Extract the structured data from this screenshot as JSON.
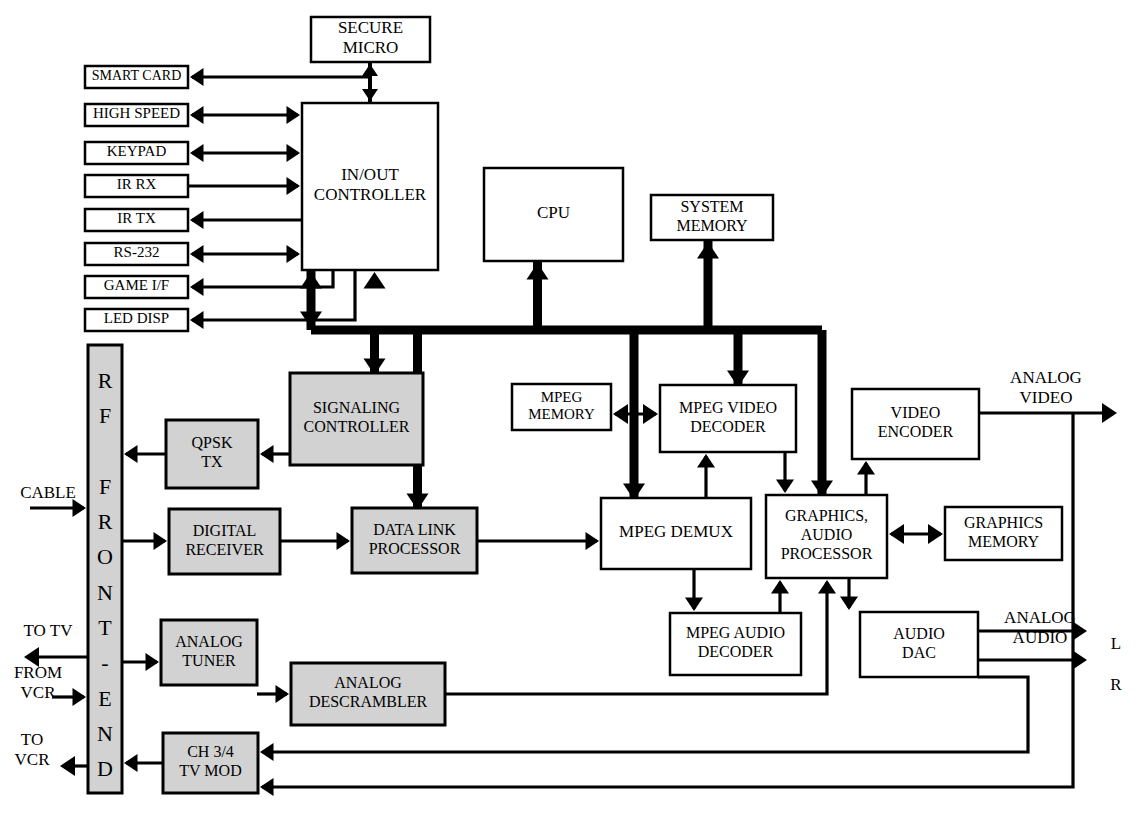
{
  "diagram": {
    "colors": {
      "shaded": "#d2d2d2",
      "plain": "#ffffff",
      "line": "#000000"
    }
  },
  "blocks": [
    {
      "id": "secure_micro",
      "label": "SECURE MICRO",
      "lines": [
        "SECURE",
        "MICRO"
      ],
      "x": 311,
      "y": 17,
      "w": 119,
      "h": 45,
      "fill": "plain",
      "stroke": 2.5,
      "fontsize": 17
    },
    {
      "id": "smart_card",
      "label": "SMART CARD",
      "lines": [
        "SMART CARD"
      ],
      "x": 85,
      "y": 66,
      "w": 103,
      "h": 22,
      "fill": "plain",
      "stroke": 2.5,
      "fontsize": 14
    },
    {
      "id": "high_speed",
      "label": "HIGH SPEED",
      "lines": [
        "HIGH SPEED"
      ],
      "x": 85,
      "y": 104,
      "w": 103,
      "h": 22,
      "fill": "plain",
      "stroke": 2.5,
      "fontsize": 15
    },
    {
      "id": "keypad",
      "label": "KEYPAD",
      "lines": [
        "KEYPAD"
      ],
      "x": 85,
      "y": 142,
      "w": 103,
      "h": 22,
      "fill": "plain",
      "stroke": 2.5,
      "fontsize": 15
    },
    {
      "id": "ir_rx",
      "label": "IR RX",
      "lines": [
        "IR RX"
      ],
      "x": 85,
      "y": 175,
      "w": 103,
      "h": 22,
      "fill": "plain",
      "stroke": 2.5,
      "fontsize": 15
    },
    {
      "id": "ir_tx",
      "label": "IR TX",
      "lines": [
        "IR TX"
      ],
      "x": 85,
      "y": 209,
      "w": 103,
      "h": 22,
      "fill": "plain",
      "stroke": 2.5,
      "fontsize": 15
    },
    {
      "id": "rs232",
      "label": "RS-232",
      "lines": [
        "RS-232"
      ],
      "x": 85,
      "y": 243,
      "w": 103,
      "h": 22,
      "fill": "plain",
      "stroke": 2.5,
      "fontsize": 15
    },
    {
      "id": "game_if",
      "label": "GAME I/F",
      "lines": [
        "GAME I/F"
      ],
      "x": 85,
      "y": 276,
      "w": 103,
      "h": 22,
      "fill": "plain",
      "stroke": 2.5,
      "fontsize": 15
    },
    {
      "id": "led_disp",
      "label": "LED DISP",
      "lines": [
        "LED DISP"
      ],
      "x": 85,
      "y": 309,
      "w": 103,
      "h": 22,
      "fill": "plain",
      "stroke": 2.5,
      "fontsize": 15
    },
    {
      "id": "in_out_controller",
      "label": "IN/OUT CONTROLLER",
      "lines": [
        "IN/OUT",
        "CONTROLLER"
      ],
      "x": 302,
      "y": 103,
      "w": 136,
      "h": 167,
      "fill": "plain",
      "stroke": 2.5,
      "fontsize": 17
    },
    {
      "id": "cpu",
      "label": "CPU",
      "lines": [
        "CPU"
      ],
      "x": 484,
      "y": 168,
      "w": 139,
      "h": 93,
      "fill": "plain",
      "stroke": 2.5,
      "fontsize": 17
    },
    {
      "id": "system_memory",
      "label": "SYSTEM MEMORY",
      "lines": [
        "SYSTEM",
        "MEMORY"
      ],
      "x": 651,
      "y": 195,
      "w": 122,
      "h": 45,
      "fill": "plain",
      "stroke": 2.5,
      "fontsize": 16
    },
    {
      "id": "rf_front_end",
      "label": "RF FRONT-END",
      "lines": [
        "R",
        "F",
        "",
        "F",
        "R",
        "O",
        "N",
        "T",
        "-",
        "E",
        "N",
        "D"
      ],
      "x": 88,
      "y": 345,
      "w": 34,
      "h": 448,
      "fill": "shaded",
      "stroke": 3,
      "fontsize": 22,
      "vertical": true
    },
    {
      "id": "signaling_controller",
      "label": "SIGNALING CONTROLLER",
      "lines": [
        "SIGNALING",
        "CONTROLLER"
      ],
      "x": 290,
      "y": 373,
      "w": 133,
      "h": 92,
      "fill": "shaded",
      "stroke": 3,
      "fontsize": 16
    },
    {
      "id": "mpeg_memory",
      "label": "MPEG MEMORY",
      "lines": [
        "MPEG",
        "MEMORY"
      ],
      "x": 512,
      "y": 384,
      "w": 99,
      "h": 46,
      "fill": "plain",
      "stroke": 2.5,
      "fontsize": 15
    },
    {
      "id": "mpeg_video_decoder",
      "label": "MPEG VIDEO DECODER",
      "lines": [
        "MPEG VIDEO",
        "DECODER"
      ],
      "x": 660,
      "y": 385,
      "w": 136,
      "h": 67,
      "fill": "plain",
      "stroke": 2.5,
      "fontsize": 16
    },
    {
      "id": "video_encoder",
      "label": "VIDEO ENCODER",
      "lines": [
        "VIDEO",
        "ENCODER"
      ],
      "x": 852,
      "y": 389,
      "w": 127,
      "h": 70,
      "fill": "plain",
      "stroke": 2.5,
      "fontsize": 16
    },
    {
      "id": "qpsk_tx",
      "label": "QPSK TX",
      "lines": [
        "QPSK",
        "TX"
      ],
      "x": 166,
      "y": 420,
      "w": 92,
      "h": 68,
      "fill": "shaded",
      "stroke": 3,
      "fontsize": 16
    },
    {
      "id": "digital_receiver",
      "label": "DIGITAL RECEIVER",
      "lines": [
        "DIGITAL",
        "RECEIVER"
      ],
      "x": 169,
      "y": 509,
      "w": 111,
      "h": 65,
      "fill": "shaded",
      "stroke": 3,
      "fontsize": 16
    },
    {
      "id": "data_link_processor",
      "label": "DATA LINK PROCESSOR",
      "lines": [
        "DATA LINK",
        "PROCESSOR"
      ],
      "x": 352,
      "y": 508,
      "w": 125,
      "h": 65,
      "fill": "shaded",
      "stroke": 3,
      "fontsize": 16
    },
    {
      "id": "mpeg_demux",
      "label": "MPEG DEMUX",
      "lines": [
        "MPEG DEMUX"
      ],
      "x": 601,
      "y": 498,
      "w": 150,
      "h": 71,
      "fill": "plain",
      "stroke": 2.5,
      "fontsize": 17
    },
    {
      "id": "graphics_audio_proc",
      "label": "GRAPHICS, AUDIO PROCESSOR",
      "lines": [
        "GRAPHICS,",
        "AUDIO",
        "PROCESSOR"
      ],
      "x": 766,
      "y": 495,
      "w": 121,
      "h": 83,
      "fill": "plain",
      "stroke": 2.5,
      "fontsize": 16
    },
    {
      "id": "graphics_memory",
      "label": "GRAPHICS MEMORY",
      "lines": [
        "GRAPHICS",
        "MEMORY"
      ],
      "x": 945,
      "y": 507,
      "w": 117,
      "h": 53,
      "fill": "plain",
      "stroke": 2.5,
      "fontsize": 16
    },
    {
      "id": "mpeg_audio_decoder",
      "label": "MPEG AUDIO DECODER",
      "lines": [
        "MPEG AUDIO",
        "DECODER"
      ],
      "x": 670,
      "y": 613,
      "w": 131,
      "h": 62,
      "fill": "plain",
      "stroke": 2.5,
      "fontsize": 16
    },
    {
      "id": "audio_dac",
      "label": "AUDIO DAC",
      "lines": [
        "AUDIO",
        "DAC"
      ],
      "x": 860,
      "y": 612,
      "w": 118,
      "h": 65,
      "fill": "plain",
      "stroke": 2.5,
      "fontsize": 16
    },
    {
      "id": "analog_tuner",
      "label": "ANALOG TUNER",
      "lines": [
        "ANALOG",
        "TUNER"
      ],
      "x": 161,
      "y": 620,
      "w": 96,
      "h": 65,
      "fill": "shaded",
      "stroke": 3,
      "fontsize": 16
    },
    {
      "id": "analog_descrambler",
      "label": "ANALOG DESCRAMBLER",
      "lines": [
        "ANALOG",
        "DESCRAMBLER"
      ],
      "x": 291,
      "y": 663,
      "w": 154,
      "h": 62,
      "fill": "shaded",
      "stroke": 3,
      "fontsize": 16
    },
    {
      "id": "ch34_tv_mod",
      "label": "CH 3/4 TV MOD",
      "lines": [
        "CH 3/4",
        "TV MOD"
      ],
      "x": 163,
      "y": 733,
      "w": 95,
      "h": 60,
      "fill": "shaded",
      "stroke": 3,
      "fontsize": 16
    }
  ],
  "io_labels": [
    {
      "id": "cable",
      "lines": [
        "CABLE"
      ],
      "x": 48,
      "y": 494,
      "anchor": "middle",
      "fontsize": 17
    },
    {
      "id": "to_tv",
      "lines": [
        "TO TV"
      ],
      "x": 48,
      "y": 632,
      "anchor": "middle",
      "fontsize": 17
    },
    {
      "id": "from_vcr",
      "lines": [
        "FROM",
        "VCR"
      ],
      "x": 38,
      "y": 674,
      "anchor": "middle",
      "fontsize": 17
    },
    {
      "id": "to_vcr",
      "lines": [
        "TO",
        "VCR"
      ],
      "x": 32,
      "y": 741,
      "anchor": "middle",
      "fontsize": 17
    },
    {
      "id": "analog_video",
      "lines": [
        "ANALOG",
        "VIDEO"
      ],
      "x": 1046,
      "y": 379,
      "anchor": "middle",
      "fontsize": 17
    },
    {
      "id": "analog_audio",
      "lines": [
        "ANALOG",
        "AUDIO"
      ],
      "x": 1040,
      "y": 619,
      "anchor": "middle",
      "fontsize": 17
    },
    {
      "id": "channel_left",
      "lines": [
        "L"
      ],
      "x": 1116,
      "y": 645,
      "anchor": "middle",
      "fontsize": 17
    },
    {
      "id": "channel_right",
      "lines": [
        "R"
      ],
      "x": 1116,
      "y": 686,
      "anchor": "middle",
      "fontsize": 17
    }
  ],
  "connections": [
    {
      "id": "secure-micro-to-iocontroller",
      "from": "secure_micro",
      "to": "in_out_controller",
      "type": "bidirectional"
    },
    {
      "id": "iocontroller-to-smart-card",
      "from": "in_out_controller",
      "to": "smart_card",
      "type": "unidirectional"
    },
    {
      "id": "iocontroller-high-speed",
      "from": "in_out_controller",
      "to": "high_speed",
      "type": "bidirectional"
    },
    {
      "id": "iocontroller-keypad",
      "from": "in_out_controller",
      "to": "keypad",
      "type": "bidirectional"
    },
    {
      "id": "ir-rx-to-iocontroller",
      "from": "ir_rx",
      "to": "in_out_controller",
      "type": "unidirectional"
    },
    {
      "id": "iocontroller-to-ir-tx",
      "from": "in_out_controller",
      "to": "ir_tx",
      "type": "unidirectional"
    },
    {
      "id": "iocontroller-rs232",
      "from": "in_out_controller",
      "to": "rs232",
      "type": "bidirectional"
    },
    {
      "id": "iocontroller-to-game-if",
      "from": "in_out_controller",
      "to": "game_if",
      "type": "unidirectional"
    },
    {
      "id": "iocontroller-to-led-disp",
      "from": "in_out_controller",
      "to": "led_disp",
      "type": "unidirectional"
    },
    {
      "id": "iocontroller-to-bus",
      "from": "in_out_controller",
      "to": "system_bus",
      "type": "bidirectional"
    },
    {
      "id": "bus-to-cpu",
      "from": "system_bus",
      "to": "cpu",
      "type": "unidirectional"
    },
    {
      "id": "bus-to-system-memory",
      "from": "system_bus",
      "to": "system_memory",
      "type": "unidirectional"
    },
    {
      "id": "bus-to-signaling-controller",
      "from": "system_bus",
      "to": "signaling_controller",
      "type": "bidirectional"
    },
    {
      "id": "bus-to-data-link-processor",
      "from": "system_bus",
      "to": "data_link_processor",
      "type": "unidirectional"
    },
    {
      "id": "bus-to-mpeg-video-decoder",
      "from": "system_bus",
      "to": "mpeg_video_decoder",
      "type": "unidirectional"
    },
    {
      "id": "bus-to-mpeg-demux",
      "from": "system_bus",
      "to": "mpeg_demux",
      "type": "unidirectional"
    },
    {
      "id": "bus-to-graphics-audio-proc",
      "from": "system_bus",
      "to": "graphics_audio_proc",
      "type": "unidirectional"
    },
    {
      "id": "signaling-to-qpsk-tx",
      "from": "signaling_controller",
      "to": "qpsk_tx",
      "type": "unidirectional"
    },
    {
      "id": "qpsk-tx-to-rf",
      "from": "qpsk_tx",
      "to": "rf_front_end",
      "type": "unidirectional"
    },
    {
      "id": "rf-to-digital-receiver",
      "from": "rf_front_end",
      "to": "digital_receiver",
      "type": "unidirectional"
    },
    {
      "id": "digital-receiver-to-dlp",
      "from": "digital_receiver",
      "to": "data_link_processor",
      "type": "unidirectional"
    },
    {
      "id": "dlp-to-mpeg-demux",
      "from": "data_link_processor",
      "to": "mpeg_demux",
      "type": "unidirectional"
    },
    {
      "id": "mpeg-memory-to-decoder",
      "from": "mpeg_memory",
      "to": "mpeg_video_decoder",
      "type": "bidirectional"
    },
    {
      "id": "demux-to-video-decoder",
      "from": "mpeg_demux",
      "to": "mpeg_video_decoder",
      "type": "unidirectional"
    },
    {
      "id": "demux-to-audio-decoder",
      "from": "mpeg_demux",
      "to": "mpeg_audio_decoder",
      "type": "unidirectional"
    },
    {
      "id": "video-decoder-to-graphics",
      "from": "mpeg_video_decoder",
      "to": "graphics_audio_proc",
      "type": "unidirectional"
    },
    {
      "id": "audio-decoder-to-graphics",
      "from": "mpeg_audio_decoder",
      "to": "graphics_audio_proc",
      "type": "unidirectional"
    },
    {
      "id": "graphics-to-video-encoder",
      "from": "graphics_audio_proc",
      "to": "video_encoder",
      "type": "unidirectional"
    },
    {
      "id": "graphics-memory-link",
      "from": "graphics_audio_proc",
      "to": "graphics_memory",
      "type": "bidirectional"
    },
    {
      "id": "graphics-to-audio-dac",
      "from": "graphics_audio_proc",
      "to": "audio_dac",
      "type": "unidirectional"
    },
    {
      "id": "video-encoder-to-analog-video",
      "from": "video_encoder",
      "to": "analog_video",
      "type": "unidirectional"
    },
    {
      "id": "audio-dac-to-analog-audio",
      "from": "audio_dac",
      "to": "analog_audio",
      "type": "unidirectional"
    },
    {
      "id": "rf-to-analog-tuner",
      "from": "rf_front_end",
      "to": "analog_tuner",
      "type": "unidirectional"
    },
    {
      "id": "analog-tuner-to-descrambler",
      "from": "analog_tuner",
      "to": "analog_descrambler",
      "type": "unidirectional"
    },
    {
      "id": "descrambler-to-graphics",
      "from": "analog_descrambler",
      "to": "graphics_audio_proc",
      "type": "unidirectional"
    },
    {
      "id": "audio-dac-to-ch34",
      "from": "audio_dac",
      "to": "ch34_tv_mod",
      "type": "unidirectional"
    },
    {
      "id": "video-out-to-ch34",
      "from": "video_encoder",
      "to": "ch34_tv_mod",
      "type": "unidirectional"
    },
    {
      "id": "ch34-to-rf",
      "from": "ch34_tv_mod",
      "to": "rf_front_end",
      "type": "unidirectional"
    },
    {
      "id": "cable-in",
      "from": "cable",
      "to": "rf_front_end",
      "type": "unidirectional"
    },
    {
      "id": "rf-to-tv",
      "from": "rf_front_end",
      "to": "to_tv",
      "type": "unidirectional"
    },
    {
      "id": "from-vcr-in",
      "from": "from_vcr",
      "to": "rf_front_end",
      "type": "unidirectional"
    },
    {
      "id": "rf-to-vcr",
      "from": "rf_front_end",
      "to": "to_vcr",
      "type": "unidirectional"
    }
  ]
}
